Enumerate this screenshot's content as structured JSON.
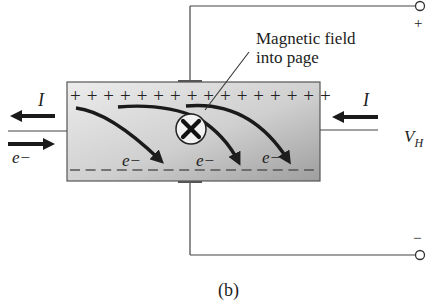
{
  "figure": {
    "caption": "(b)",
    "annotation": {
      "line1": "Magnetic field",
      "line2": "into page"
    },
    "labels": {
      "current_left": "I",
      "current_right": "I",
      "electron_left": "e−",
      "electron_1": "e−",
      "electron_2": "e−",
      "electron_3": "e−",
      "hall_voltage_main": "V",
      "hall_voltage_sub": "H",
      "terminal_positive": "+",
      "terminal_negative": "−"
    },
    "top_charges": "+ + + + + + + + + + + + + + + +",
    "top_charge_count": 16,
    "bottom_charge_count": 16,
    "symbols": {
      "field_into_page": "cross-in-circle"
    },
    "colors": {
      "ink": "#1e1e1e",
      "wire": "#444444",
      "slab_light": "#e4e4e4",
      "slab_dark": "#a9a9a9",
      "background": "#ffffff"
    }
  }
}
